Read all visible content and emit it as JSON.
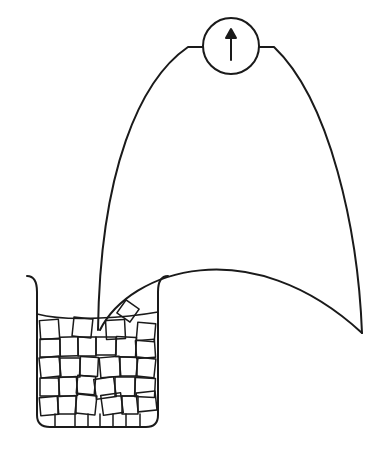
{
  "diagram": {
    "description": "Meter connected by two wires forming a loop; one junction immersed in a beaker of ice cubes and water",
    "meter": {
      "icon": "arrow-up-needle",
      "center": [
        231,
        45
      ],
      "radius": 28
    },
    "beaker": {
      "contents": "ice cubes in water"
    },
    "colors": {
      "stroke": "#1a1a1a",
      "background": "#ffffff"
    }
  }
}
